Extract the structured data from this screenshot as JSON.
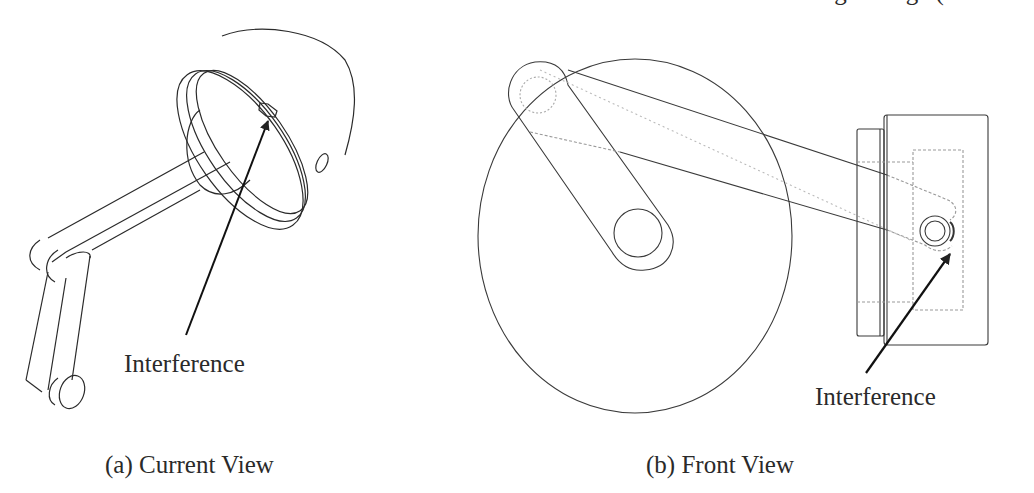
{
  "header": {
    "cut_off_text": "Rating Change ("
  },
  "panels": [
    {
      "id": "a",
      "caption": "(a) Current View",
      "annotation": "Interference",
      "subject": "isometric view of crank, connecting rod and piston"
    },
    {
      "id": "b",
      "caption": "(b) Front View",
      "annotation": "Interference",
      "subject": "front view of crank disk, connecting rod and piston"
    }
  ],
  "colors": {
    "line": "#2a2a2a",
    "hidden_line": "#9a9a9a",
    "background": "#ffffff"
  }
}
